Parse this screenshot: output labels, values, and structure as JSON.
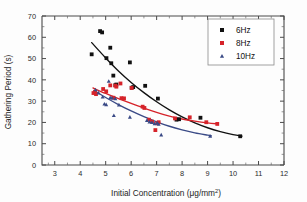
{
  "chart_data": {
    "type": "scatter",
    "title": "",
    "xlabel": "Initial Concentration (μg/mm²)",
    "xlabel_base": "Initial Concentration (μg/mm",
    "xlabel_sup": "2",
    "xlabel_tail": ")",
    "ylabel": "Gathering Period (s)",
    "xlim": [
      2.5,
      12
    ],
    "ylim": [
      0,
      70
    ],
    "xticks": [
      3,
      4,
      5,
      6,
      7,
      8,
      9,
      10,
      11,
      12
    ],
    "yticks": [
      0,
      10,
      20,
      30,
      40,
      50,
      60,
      70
    ],
    "xtick_labels": [
      "3",
      "4",
      "5",
      "6",
      "7",
      "8",
      "9",
      "10",
      "11",
      "12"
    ],
    "ytick_labels": [
      "0",
      "10",
      "20",
      "30",
      "40",
      "50",
      "60",
      "70"
    ],
    "minor_ticks_per_interval": 1,
    "grid": false,
    "legend_position": "top-right",
    "series": [
      {
        "name": "6Hz",
        "label": "6Hz",
        "color": "#111111",
        "marker": "square",
        "points": [
          [
            4.45,
            52.0
          ],
          [
            4.78,
            62.9
          ],
          [
            4.86,
            62.3
          ],
          [
            5.03,
            50.2
          ],
          [
            5.18,
            55.1
          ],
          [
            5.22,
            47.8
          ],
          [
            5.3,
            42.0
          ],
          [
            5.38,
            37.5
          ],
          [
            5.42,
            37.8
          ],
          [
            5.95,
            48.2
          ],
          [
            6.02,
            36.3
          ],
          [
            6.08,
            36.6
          ],
          [
            6.55,
            37.2
          ],
          [
            7.05,
            31.2
          ],
          [
            7.78,
            21.3
          ],
          [
            7.88,
            21.5
          ],
          [
            8.72,
            22.2
          ],
          [
            10.28,
            13.5
          ]
        ],
        "fit": [
          [
            4.45,
            57.5
          ],
          [
            5.0,
            50.3
          ],
          [
            5.5,
            44.2
          ],
          [
            6.0,
            38.8
          ],
          [
            6.5,
            34.0
          ],
          [
            7.0,
            29.7
          ],
          [
            7.5,
            25.9
          ],
          [
            8.0,
            22.6
          ],
          [
            8.5,
            19.8
          ],
          [
            9.0,
            17.5
          ],
          [
            9.5,
            15.7
          ],
          [
            10.0,
            14.3
          ],
          [
            10.35,
            13.6
          ]
        ]
      },
      {
        "name": "8Hz",
        "label": "8Hz",
        "color": "#d6232a",
        "marker": "square",
        "points": [
          [
            4.52,
            33.8
          ],
          [
            4.58,
            34.4
          ],
          [
            4.62,
            33.3
          ],
          [
            4.9,
            35.7
          ],
          [
            5.02,
            34.6
          ],
          [
            5.18,
            37.4
          ],
          [
            5.3,
            31.6
          ],
          [
            5.38,
            37.3
          ],
          [
            5.42,
            36.8
          ],
          [
            5.58,
            38.3
          ],
          [
            5.62,
            31.4
          ],
          [
            5.72,
            31.3
          ],
          [
            6.02,
            36.2
          ],
          [
            6.45,
            27.4
          ],
          [
            6.52,
            26.8
          ],
          [
            6.7,
            21.3
          ],
          [
            6.82,
            20.4
          ],
          [
            6.95,
            16.4
          ],
          [
            7.02,
            19.6
          ],
          [
            7.08,
            20.1
          ],
          [
            7.72,
            21.9
          ],
          [
            8.3,
            22.4
          ],
          [
            8.95,
            20.1
          ],
          [
            9.38,
            19.3
          ]
        ],
        "fit": [
          [
            4.5,
            36.2
          ],
          [
            5.0,
            33.6
          ],
          [
            5.5,
            31.2
          ],
          [
            6.0,
            28.9
          ],
          [
            6.5,
            26.7
          ],
          [
            7.0,
            24.7
          ],
          [
            7.5,
            23.0
          ],
          [
            8.0,
            21.6
          ],
          [
            8.5,
            20.6
          ],
          [
            9.0,
            19.8
          ],
          [
            9.42,
            19.3
          ]
        ]
      },
      {
        "name": "10Hz",
        "label": "10Hz",
        "color": "#3a4a86",
        "marker": "triangle",
        "points": [
          [
            4.6,
            35.4
          ],
          [
            4.72,
            33.9
          ],
          [
            4.88,
            32.0
          ],
          [
            4.95,
            28.7
          ],
          [
            5.02,
            28.4
          ],
          [
            5.12,
            39.4
          ],
          [
            5.18,
            31.7
          ],
          [
            5.25,
            31.5
          ],
          [
            5.32,
            23.3
          ],
          [
            5.38,
            31.2
          ],
          [
            5.52,
            28.3
          ],
          [
            5.95,
            22.5
          ],
          [
            6.62,
            21.0
          ],
          [
            6.72,
            20.3
          ],
          [
            6.82,
            20.0
          ],
          [
            6.92,
            19.5
          ],
          [
            7.02,
            19.8
          ],
          [
            7.08,
            19.2
          ],
          [
            7.18,
            14.2
          ],
          [
            9.1,
            13.6
          ]
        ],
        "fit": [
          [
            4.6,
            34.6
          ],
          [
            5.0,
            31.7
          ],
          [
            5.5,
            28.4
          ],
          [
            6.0,
            25.4
          ],
          [
            6.5,
            22.7
          ],
          [
            7.0,
            20.3
          ],
          [
            7.5,
            18.2
          ],
          [
            8.0,
            16.5
          ],
          [
            8.5,
            15.1
          ],
          [
            9.0,
            14.0
          ],
          [
            9.15,
            13.7
          ]
        ]
      }
    ]
  }
}
